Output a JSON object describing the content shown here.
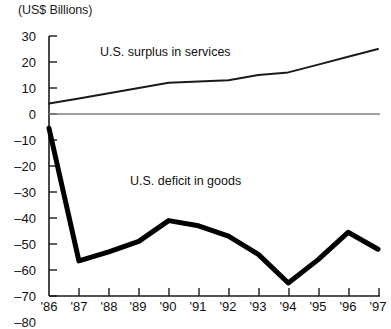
{
  "chart_data": {
    "type": "line",
    "title": "",
    "subtitle": "",
    "unit_label": "(US$ Billions)",
    "xlabel": "",
    "ylabel": "",
    "x": [
      "'86",
      "'87",
      "'88",
      "'89",
      "'90",
      "'91",
      "'92",
      "'93",
      "'94",
      "'95",
      "'96",
      "'97"
    ],
    "categories": [
      "'86",
      "'87",
      "'88",
      "'89",
      "'90",
      "'91",
      "'92",
      "'93",
      "'94",
      "'95",
      "'96",
      "'97"
    ],
    "xlim": [
      1986,
      1997
    ],
    "ylim": [
      -80,
      30
    ],
    "yticks": [
      30,
      20,
      10,
      0,
      -10,
      -20,
      -30,
      -40,
      -50,
      -60,
      -70,
      -80
    ],
    "ytick_labels": [
      "30",
      "20",
      "10",
      "0",
      "–10",
      "–20",
      "–30",
      "–40",
      "–50",
      "–60",
      "–70",
      "–80"
    ],
    "grid": false,
    "legend_position": "inline-annotations",
    "zero_line": true,
    "series": [
      {
        "name": "U.S. surplus in services",
        "color": "#1a1a1a",
        "line_width": 2,
        "label_text": "U.S. surplus in services",
        "values": [
          4,
          6,
          8,
          10,
          12,
          12.5,
          13,
          15,
          16,
          19,
          22,
          25
        ]
      },
      {
        "name": "U.S. deficit in goods",
        "color": "#000000",
        "line_width": 5,
        "label_text": "U.S. deficit in goods",
        "values": [
          -5.5,
          -56.5,
          -53,
          -49,
          -41,
          -43,
          -47,
          -54,
          -65,
          -56,
          -45.5,
          -52
        ]
      }
    ],
    "annotations": [
      {
        "text": "U.S. surplus in services",
        "x_value": "'88",
        "y_value": 21
      },
      {
        "text": "U.S. deficit in goods",
        "x_value": "'91",
        "y_value": -33
      }
    ]
  },
  "axes": {
    "unit_label": "(US$ Billions)",
    "y_labels": [
      "30",
      "20",
      "10",
      "0",
      "–10",
      "–20",
      "–30",
      "–40",
      "–50",
      "–60",
      "–70",
      "–80"
    ],
    "x_labels": [
      "'86",
      "'87",
      "'88",
      "'89",
      "'90",
      "'91",
      "'92",
      "'93",
      "'94",
      "'95",
      "'96",
      "'97"
    ]
  },
  "annotations": {
    "surplus": "U.S. surplus in services",
    "deficit": "U.S. deficit in goods"
  },
  "colors": {
    "axis": "#1a1a1a",
    "zero_line": "#808080",
    "surplus_line": "#1a1a1a",
    "deficit_line": "#000000",
    "background": "#ffffff"
  }
}
